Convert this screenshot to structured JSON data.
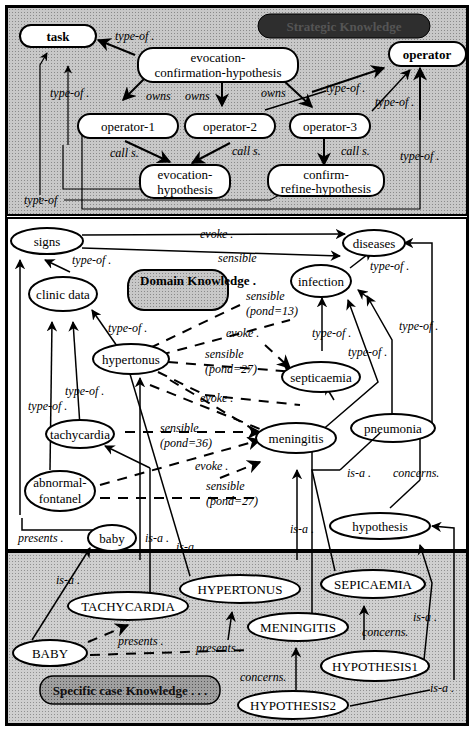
{
  "sections": {
    "strategic": {
      "label": "Strategic Knowledge",
      "fill": "#b8b8b8",
      "label_fill": "#3a3a3a"
    },
    "domain": {
      "label": "Domain Knowledge .",
      "fill": "#ffffff",
      "label_fill": "#a8a8a8"
    },
    "specific": {
      "label": "Specific case Knowledge . . .",
      "fill": "#c4c4c4",
      "label_fill": "#7a7a7a"
    }
  },
  "nodes": {
    "task": "task",
    "ech": [
      "evocation-",
      "confirmation-hypothesis"
    ],
    "operator": "operator",
    "op1": "operator-1",
    "op2": "operator-2",
    "op3": "operator-3",
    "evoc": [
      "evocation-",
      "hypothesis"
    ],
    "crh": [
      "confirm-",
      "refine-hypothesis"
    ],
    "signs": "signs",
    "diseases": "diseases",
    "clinic": "clinic data",
    "infection": "infection",
    "hypertonus": "hypertonus",
    "septicaemia": "septicaemia",
    "tachycardia": "tachycardia",
    "meningitis": "meningitis",
    "pneumonia": "pneumonia",
    "abnormal": [
      "abnormal-",
      "fontanel"
    ],
    "hypothesis": "hypothesis",
    "baby": "baby",
    "HYPERTONUS": "HYPERTONUS",
    "SEPICAEMIA": "SEPICAEMIA",
    "TACHYCARDIA": "TACHYCARDIA",
    "MENINGITIS": "MENINGITIS",
    "BABY": "BABY",
    "HYPOTHESIS1": "HYPOTHESIS1",
    "HYPOTHESIS2": "HYPOTHESIS2"
  },
  "edge_labels": {
    "typeof": "type-of .",
    "typeof_nodot": "type-of",
    "owns": "owns",
    "calls": "call s.",
    "evoke": "evoke .",
    "sensible": "sensible",
    "pond13": "(pond=13)",
    "pond27": "(pond=27)",
    "pond36": "(pond=36)",
    "isa": "is-a .",
    "presents": "presents .",
    "concerns": "concerns."
  }
}
